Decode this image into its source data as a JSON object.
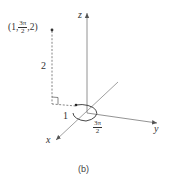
{
  "figure": {
    "caption": "(b)",
    "axes": {
      "x_label": "x",
      "y_label": "y",
      "z_label": "z"
    },
    "point": {
      "label_open": "(1,",
      "theta_num": "3π",
      "theta_den": "2",
      "label_close": ",2)",
      "r": "1",
      "theta": "3π/2",
      "z": "2"
    },
    "annotations": {
      "height_label": "2",
      "radius_label": "1",
      "angle_num": "3π",
      "angle_den": "2"
    },
    "colors": {
      "axis": "#555555",
      "dashed": "#666666",
      "text": "#333333"
    }
  }
}
